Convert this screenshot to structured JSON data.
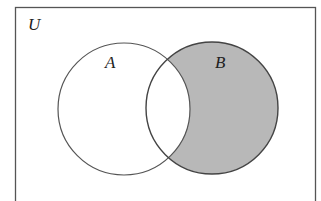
{
  "diagram": {
    "type": "venn",
    "universe_label": "U",
    "sets": [
      {
        "label": "A",
        "shaded": false
      },
      {
        "label": "B",
        "shaded": true
      }
    ],
    "shaded_region": "B minus A",
    "colors": {
      "stroke": "#444444",
      "shade": "#b8b8b8",
      "background": "#ffffff"
    }
  }
}
